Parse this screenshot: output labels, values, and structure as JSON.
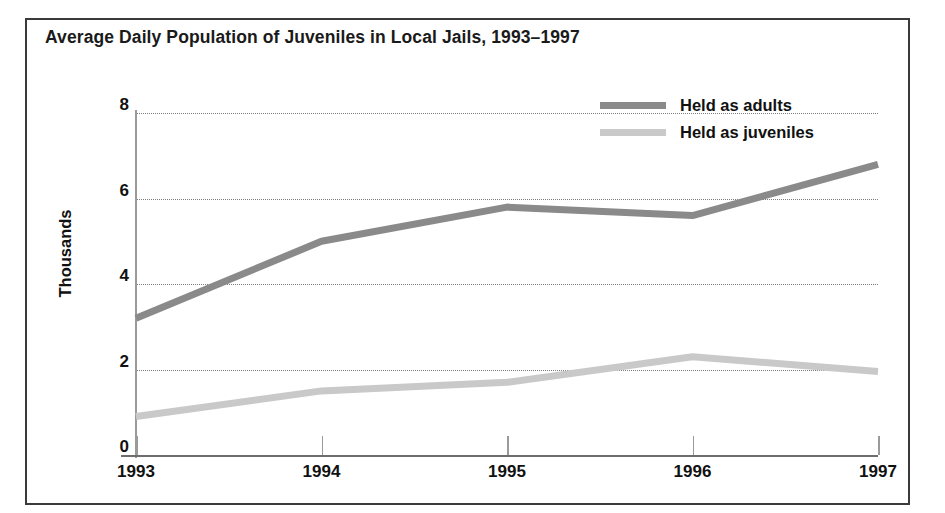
{
  "figure": {
    "title": "Average Daily Population of Juveniles in Local Jails, 1993–1997"
  },
  "legend": {
    "position": "top-right",
    "items": [
      {
        "label": "Held as adults",
        "color": "#8a8a8a",
        "swatch": "line-swatch"
      },
      {
        "label": "Held as juveniles",
        "color": "#c9c9c9",
        "swatch": "line-swatch"
      }
    ]
  },
  "axes": {
    "y": {
      "title": "Thousands",
      "ticks": [
        "0",
        "2",
        "4",
        "6",
        "8"
      ]
    },
    "x": {
      "ticks": [
        "1993",
        "1994",
        "1995",
        "1996",
        "1997"
      ]
    }
  },
  "chart_data": {
    "type": "line",
    "title": "Average Daily Population of Juveniles in Local Jails, 1993–1997",
    "xlabel": "",
    "ylabel": "Thousands",
    "categories": [
      "1993",
      "1994",
      "1995",
      "1996",
      "1997"
    ],
    "x": [
      1993,
      1994,
      1995,
      1996,
      1997
    ],
    "ylim": [
      0,
      8
    ],
    "yticks": [
      0,
      2,
      4,
      6,
      8
    ],
    "grid": "horizontal-dotted",
    "legend_position": "top-right",
    "series": [
      {
        "name": "Held as adults",
        "color": "#8a8a8a",
        "values": [
          3.2,
          5.0,
          5.8,
          5.6,
          6.8
        ]
      },
      {
        "name": "Held as juveniles",
        "color": "#c9c9c9",
        "values": [
          0.9,
          1.5,
          1.7,
          2.3,
          1.95
        ]
      }
    ]
  }
}
